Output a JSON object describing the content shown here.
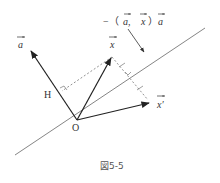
{
  "diagram": {
    "caption": "図5-5",
    "labels": {
      "origin": "O",
      "foot": "H",
      "vector_a": "a",
      "vector_x": "x",
      "vector_x_prime": "x′",
      "reflection_term_prefix": "−（",
      "reflection_term_a1": "a,",
      "reflection_term_x": "x",
      "reflection_term_close": "）",
      "reflection_term_a2": "a"
    },
    "colors": {
      "line": "#555555",
      "vector": "#222222",
      "dashed": "#777777",
      "background": "#ffffff"
    }
  }
}
